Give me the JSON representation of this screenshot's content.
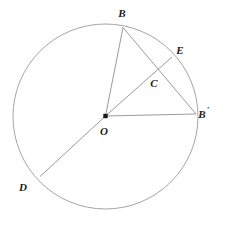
{
  "figure": {
    "background_color": "#ffffff",
    "stroke_color": "#8a8a8a",
    "label_color": "#1a1a1a"
  },
  "circle": {
    "name": "main-circle",
    "cx": 105.5,
    "cy": 116.5,
    "r": 92.5,
    "stroke": "#9a9a9a",
    "stroke_width": 0.9,
    "fill": "none"
  },
  "points": {
    "O": {
      "label": "O",
      "x": 105.5,
      "y": 116.0,
      "label_x": 104,
      "label_y": 135,
      "marker": "filled-square-dot",
      "marker_size": 4.4
    },
    "B": {
      "label": "B",
      "x": 123.0,
      "y": 27.5,
      "label_x": 122,
      "label_y": 17,
      "marker": "none"
    },
    "Bprime": {
      "label": "B",
      "prime": "′",
      "x": 196.0,
      "y": 114.0,
      "label_x": 204,
      "label_y": 118,
      "marker": "none"
    },
    "C": {
      "label": "C",
      "x": 157.0,
      "y": 70.0,
      "label_x": 154,
      "label_y": 87,
      "marker": "none"
    },
    "E": {
      "label": "E",
      "x": 172.0,
      "y": 57.0,
      "label_x": 180,
      "label_y": 54,
      "marker": "none"
    },
    "D": {
      "label": "D",
      "x": 40.0,
      "y": 176.5,
      "label_x": 23,
      "label_y": 191,
      "marker": "none"
    }
  },
  "segments": [
    {
      "name": "segment-OB",
      "from": "O",
      "to": "B",
      "d": "M 105.5 116 L 123 27.5"
    },
    {
      "name": "segment-OD",
      "from": "O",
      "to": "D",
      "d": "M 105.5 116 L 40 176.5"
    },
    {
      "name": "segment-OBprime",
      "from": "O",
      "to": "Bprime",
      "d": "M 105.5 116 L 196 114"
    },
    {
      "name": "segment-OE",
      "from": "O",
      "to": "E",
      "d": "M 105.5 116 L 172 57"
    },
    {
      "name": "segment-BBprime",
      "from": "B",
      "to": "Bprime",
      "d": "M 123 27.5 L 196 114"
    }
  ],
  "labels_order": [
    "B",
    "E",
    "C",
    "Bprime",
    "O",
    "D"
  ]
}
